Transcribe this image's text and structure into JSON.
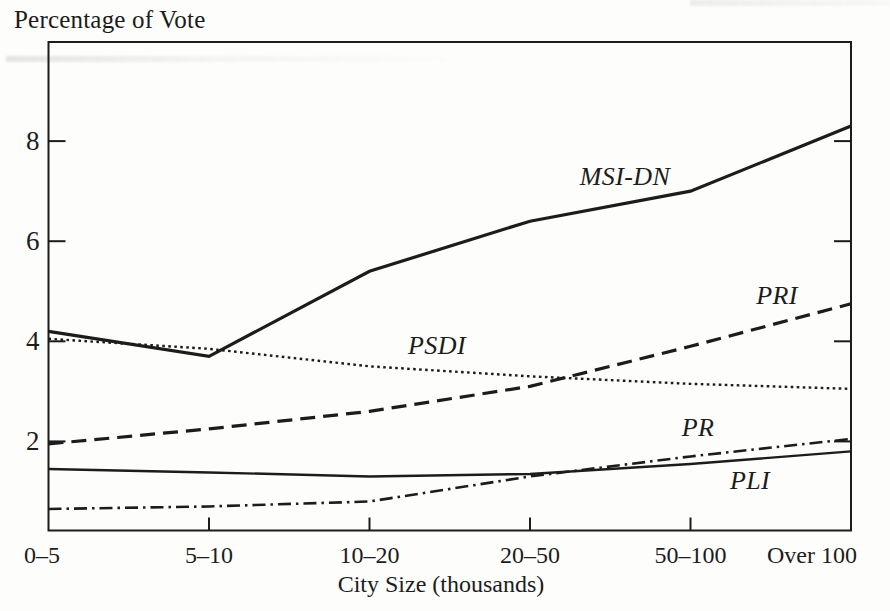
{
  "chart_data": {
    "type": "line",
    "title": "Percentage of Vote",
    "xlabel": "City Size (thousands)",
    "ylabel": "",
    "categories": [
      "0–5",
      "5–10",
      "10–20",
      "20–50",
      "50–100",
      "Over 100"
    ],
    "y_ticks": [
      2,
      4,
      6,
      8
    ],
    "ylim": [
      0.22,
      9.98
    ],
    "grid": false,
    "legend": "inline-italic-labels-on-lines",
    "ink_color": "#1c1c1c",
    "paper_color": "#fdfdfc",
    "series": [
      {
        "name": "MSI-DN",
        "line_style": "solid-thick",
        "values": [
          4.2,
          3.7,
          5.4,
          6.4,
          7.0,
          8.3
        ],
        "label": {
          "x": 625,
          "y": 176
        }
      },
      {
        "name": "PSDI",
        "line_style": "dotted",
        "values": [
          4.05,
          3.85,
          3.5,
          3.3,
          3.15,
          3.05
        ],
        "label": {
          "x": 437,
          "y": 345
        }
      },
      {
        "name": "PRI",
        "line_style": "dashed",
        "values": [
          1.95,
          2.25,
          2.6,
          3.1,
          3.9,
          4.75
        ],
        "label": {
          "x": 777,
          "y": 295
        }
      },
      {
        "name": "PR",
        "line_style": "dash-dot",
        "values": [
          0.65,
          0.7,
          0.8,
          1.3,
          1.7,
          2.05
        ],
        "label": {
          "x": 698,
          "y": 427
        }
      },
      {
        "name": "PLI",
        "line_style": "solid",
        "values": [
          1.45,
          1.38,
          1.3,
          1.35,
          1.55,
          1.8
        ],
        "label": {
          "x": 750,
          "y": 480
        }
      }
    ]
  }
}
